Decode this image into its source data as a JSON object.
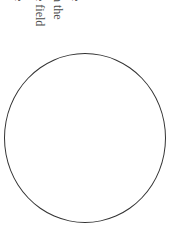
{
  "text": {
    "lines": [
      {
        "text": "e"
      },
      {
        "text": "n the"
      },
      {
        "text": "e field"
      },
      {
        "text": "e"
      }
    ]
  },
  "figure": {
    "shape": "circle-outline",
    "stroke_color": "#333333"
  }
}
